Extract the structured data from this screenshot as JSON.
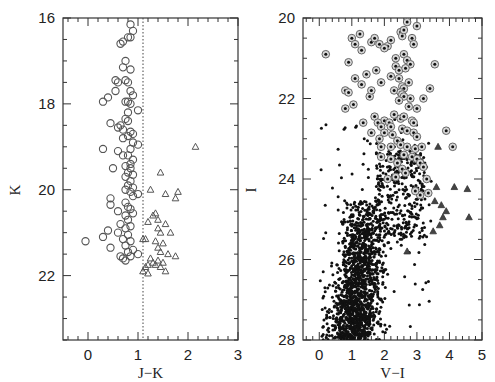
{
  "chart_data": [
    {
      "type": "scatter",
      "panel": "left",
      "title": "",
      "xlabel": "J-K",
      "ylabel": "K",
      "xlim": [
        -0.5,
        3.0
      ],
      "ylim": [
        23.5,
        16.0
      ],
      "y_inverted": true,
      "xticks": [
        0,
        1,
        2,
        3
      ],
      "yticks": [
        16,
        18,
        20,
        22
      ],
      "grid": false,
      "reference_line": {
        "x": 1.1,
        "style": "dotted"
      },
      "series": [
        {
          "name": "circles (J-K < 1.1)",
          "marker": "open-circle",
          "points": [
            [
              0.85,
              16.15
            ],
            [
              0.9,
              16.3
            ],
            [
              0.85,
              16.45
            ],
            [
              0.8,
              16.45
            ],
            [
              0.7,
              16.55
            ],
            [
              0.65,
              16.6
            ],
            [
              0.75,
              17.0
            ],
            [
              0.7,
              17.15
            ],
            [
              0.85,
              17.2
            ],
            [
              0.6,
              17.5
            ],
            [
              0.55,
              17.45
            ],
            [
              0.75,
              17.45
            ],
            [
              0.8,
              17.5
            ],
            [
              0.55,
              17.7
            ],
            [
              0.85,
              17.7
            ],
            [
              0.9,
              17.8
            ],
            [
              0.8,
              17.95
            ],
            [
              0.3,
              17.95
            ],
            [
              0.4,
              17.85
            ],
            [
              0.75,
              17.95
            ],
            [
              0.85,
              18.0
            ],
            [
              0.8,
              18.2
            ],
            [
              1.0,
              18.15
            ],
            [
              0.75,
              18.35
            ],
            [
              0.8,
              18.4
            ],
            [
              0.45,
              18.45
            ],
            [
              0.6,
              18.55
            ],
            [
              0.65,
              18.5
            ],
            [
              0.7,
              18.6
            ],
            [
              0.85,
              18.65
            ],
            [
              0.9,
              18.7
            ],
            [
              0.8,
              18.75
            ],
            [
              0.7,
              18.8
            ],
            [
              0.9,
              18.9
            ],
            [
              1.0,
              18.95
            ],
            [
              0.85,
              19.05
            ],
            [
              0.3,
              19.05
            ],
            [
              0.6,
              19.1
            ],
            [
              0.7,
              19.2
            ],
            [
              0.8,
              19.2
            ],
            [
              0.9,
              19.3
            ],
            [
              0.85,
              19.4
            ],
            [
              0.75,
              19.45
            ],
            [
              0.5,
              19.5
            ],
            [
              0.85,
              19.5
            ],
            [
              0.8,
              19.6
            ],
            [
              0.9,
              19.65
            ],
            [
              0.75,
              19.7
            ],
            [
              0.85,
              19.8
            ],
            [
              0.8,
              19.9
            ],
            [
              0.9,
              19.95
            ],
            [
              0.75,
              20.0
            ],
            [
              0.85,
              20.05
            ],
            [
              1.0,
              20.1
            ],
            [
              0.9,
              20.15
            ],
            [
              0.45,
              20.2
            ],
            [
              0.45,
              20.35
            ],
            [
              0.75,
              20.3
            ],
            [
              0.8,
              20.4
            ],
            [
              0.85,
              20.45
            ],
            [
              0.6,
              20.5
            ],
            [
              0.9,
              20.55
            ],
            [
              0.75,
              20.6
            ],
            [
              0.8,
              20.7
            ],
            [
              0.65,
              20.8
            ],
            [
              0.85,
              20.85
            ],
            [
              0.75,
              20.9
            ],
            [
              0.4,
              20.95
            ],
            [
              0.6,
              21.0
            ],
            [
              0.8,
              21.05
            ],
            [
              0.3,
              21.1
            ],
            [
              0.7,
              21.15
            ],
            [
              0.85,
              21.2
            ],
            [
              -0.05,
              21.2
            ],
            [
              0.45,
              21.35
            ],
            [
              0.75,
              21.3
            ],
            [
              0.9,
              21.4
            ],
            [
              0.8,
              21.45
            ],
            [
              0.65,
              21.55
            ],
            [
              0.7,
              21.6
            ],
            [
              0.85,
              21.55
            ],
            [
              1.0,
              21.5
            ],
            [
              0.75,
              21.65
            ]
          ]
        },
        {
          "name": "triangles (J-K > 1.1)",
          "marker": "open-triangle",
          "points": [
            [
              2.15,
              19.0
            ],
            [
              1.45,
              19.6
            ],
            [
              1.25,
              20.0
            ],
            [
              1.55,
              20.1
            ],
            [
              1.8,
              20.05
            ],
            [
              1.75,
              20.2
            ],
            [
              1.35,
              20.55
            ],
            [
              1.3,
              20.6
            ],
            [
              1.2,
              20.75
            ],
            [
              1.4,
              20.7
            ],
            [
              1.55,
              20.8
            ],
            [
              1.4,
              20.9
            ],
            [
              1.45,
              21.0
            ],
            [
              1.65,
              21.0
            ],
            [
              1.15,
              21.15
            ],
            [
              1.1,
              21.15
            ],
            [
              1.35,
              21.2
            ],
            [
              1.5,
              21.25
            ],
            [
              1.4,
              21.35
            ],
            [
              1.45,
              21.45
            ],
            [
              1.6,
              21.5
            ],
            [
              1.25,
              21.6
            ],
            [
              1.4,
              21.65
            ],
            [
              1.5,
              21.7
            ],
            [
              1.35,
              21.75
            ],
            [
              1.15,
              21.8
            ],
            [
              1.2,
              21.75
            ],
            [
              1.3,
              21.7
            ],
            [
              1.45,
              21.8
            ],
            [
              1.55,
              21.9
            ],
            [
              1.1,
              21.9
            ],
            [
              1.2,
              21.95
            ],
            [
              1.75,
              21.55
            ]
          ]
        }
      ]
    },
    {
      "type": "scatter",
      "panel": "right",
      "title": "",
      "xlabel": "V-I",
      "ylabel": "I",
      "xlim": [
        -0.5,
        5.0
      ],
      "ylim": [
        28.0,
        20.0
      ],
      "y_inverted": true,
      "xticks": [
        0,
        1,
        2,
        3,
        4,
        5
      ],
      "yticks": [
        20,
        22,
        24,
        26,
        28
      ],
      "grid": false,
      "series": [
        {
          "name": "dots (all stars, dense RGB/RC cloud)",
          "marker": "filled-dot",
          "distribution": {
            "main_clump": {
              "vi_center": 1.3,
              "vi_spread": 0.35,
              "i_range": [
                24.5,
                28.0
              ],
              "count": 1400
            },
            "upper_band": {
              "vi_center": 2.2,
              "vi_spread": 0.6,
              "i_range": [
                23.3,
                25.5
              ],
              "count": 300
            },
            "sparse": {
              "vi_range": [
                0.0,
                3.5
              ],
              "i_range": [
                22.5,
                28.0
              ],
              "count": 120
            }
          }
        },
        {
          "name": "circled dots (cross-matched with K)",
          "marker": "circled-dot",
          "points": [
            [
              0.2,
              20.9
            ],
            [
              1.0,
              20.5
            ],
            [
              1.1,
              20.65
            ],
            [
              1.25,
              20.4
            ],
            [
              1.6,
              20.6
            ],
            [
              1.7,
              20.5
            ],
            [
              1.85,
              20.65
            ],
            [
              2.1,
              20.7
            ],
            [
              2.2,
              20.55
            ],
            [
              2.5,
              20.35
            ],
            [
              2.55,
              20.45
            ],
            [
              2.6,
              20.3
            ],
            [
              2.7,
              20.1
            ],
            [
              3.0,
              20.2
            ],
            [
              2.85,
              20.5
            ],
            [
              2.9,
              20.65
            ],
            [
              1.3,
              20.8
            ],
            [
              2.0,
              20.75
            ],
            [
              2.35,
              21.0
            ],
            [
              2.6,
              20.9
            ],
            [
              2.7,
              21.05
            ],
            [
              2.35,
              21.2
            ],
            [
              2.45,
              21.3
            ],
            [
              2.8,
              21.15
            ],
            [
              0.9,
              21.1
            ],
            [
              1.75,
              21.3
            ],
            [
              3.55,
              21.15
            ],
            [
              2.65,
              21.25
            ],
            [
              1.1,
              21.5
            ],
            [
              1.45,
              21.4
            ],
            [
              2.2,
              21.45
            ],
            [
              2.45,
              21.5
            ],
            [
              2.75,
              21.6
            ],
            [
              2.55,
              21.7
            ],
            [
              2.6,
              21.75
            ],
            [
              1.3,
              21.65
            ],
            [
              1.9,
              21.6
            ],
            [
              2.3,
              21.8
            ],
            [
              2.5,
              21.85
            ],
            [
              2.55,
              21.9
            ],
            [
              0.8,
              21.8
            ],
            [
              0.9,
              21.85
            ],
            [
              1.55,
              21.95
            ],
            [
              1.6,
              21.8
            ],
            [
              2.8,
              22.0
            ],
            [
              3.2,
              22.0
            ],
            [
              3.4,
              21.75
            ],
            [
              2.6,
              21.95
            ],
            [
              2.45,
              22.05
            ],
            [
              2.75,
              22.2
            ],
            [
              3.0,
              22.25
            ],
            [
              0.8,
              22.25
            ],
            [
              1.05,
              22.15
            ],
            [
              1.35,
              22.6
            ],
            [
              1.7,
              22.45
            ],
            [
              2.0,
              22.55
            ],
            [
              2.15,
              22.6
            ],
            [
              2.3,
              22.4
            ],
            [
              2.5,
              22.5
            ],
            [
              2.6,
              22.45
            ],
            [
              2.85,
              22.55
            ],
            [
              2.9,
              22.6
            ],
            [
              1.8,
              22.6
            ],
            [
              1.9,
              22.7
            ],
            [
              2.2,
              22.7
            ],
            [
              2.55,
              22.75
            ],
            [
              2.7,
              22.8
            ],
            [
              1.6,
              22.85
            ],
            [
              2.0,
              22.85
            ],
            [
              2.25,
              22.9
            ],
            [
              2.9,
              22.85
            ],
            [
              3.0,
              22.95
            ],
            [
              3.9,
              22.8
            ],
            [
              1.85,
              23.0
            ],
            [
              2.4,
              23.05
            ],
            [
              2.5,
              23.15
            ],
            [
              2.7,
              23.2
            ],
            [
              2.95,
              23.25
            ],
            [
              3.15,
              23.2
            ],
            [
              4.1,
              23.2
            ],
            [
              1.9,
              23.2
            ],
            [
              2.2,
              23.2
            ],
            [
              2.6,
              23.4
            ],
            [
              2.85,
              23.45
            ],
            [
              3.0,
              23.5
            ],
            [
              3.1,
              23.6
            ],
            [
              3.2,
              23.7
            ],
            [
              2.4,
              23.6
            ],
            [
              2.55,
              23.75
            ],
            [
              2.65,
              23.85
            ],
            [
              2.2,
              23.5
            ],
            [
              1.9,
              23.45
            ],
            [
              2.35,
              23.95
            ],
            [
              2.1,
              24.0
            ],
            [
              3.3,
              24.0
            ],
            [
              3.35,
              24.35
            ],
            [
              3.1,
              24.4
            ],
            [
              2.95,
              24.3
            ]
          ]
        },
        {
          "name": "filled triangles (red AGB)",
          "marker": "filled-triangle",
          "points": [
            [
              3.65,
              23.2
            ],
            [
              3.6,
              24.2
            ],
            [
              4.15,
              24.2
            ],
            [
              4.55,
              24.25
            ],
            [
              3.55,
              24.55
            ],
            [
              3.75,
              24.65
            ],
            [
              3.9,
              24.8
            ],
            [
              3.8,
              24.95
            ],
            [
              4.6,
              24.95
            ],
            [
              3.7,
              25.15
            ],
            [
              3.5,
              25.3
            ],
            [
              2.7,
              25.8
            ]
          ]
        }
      ]
    }
  ]
}
